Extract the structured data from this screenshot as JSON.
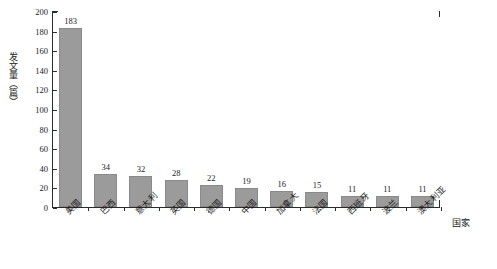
{
  "chart_data": {
    "type": "bar",
    "title": "",
    "xlabel": "国家",
    "ylabel": "发文量（篇）",
    "ylim": [
      0,
      200
    ],
    "ytick_step": 20,
    "yticks": [
      0,
      20,
      40,
      60,
      80,
      100,
      120,
      140,
      160,
      180,
      200
    ],
    "grid": false,
    "legend": null,
    "bar_color": "#9b9b9b",
    "axis_color": "#2b2b2b",
    "value_labels_shown": true,
    "categories": [
      "美国",
      "巴西",
      "意大利",
      "英国",
      "德国",
      "中国",
      "加拿大",
      "法国",
      "西班牙",
      "波兰",
      "澳大利亚"
    ],
    "values": [
      183,
      34,
      32,
      28,
      22,
      19,
      16,
      15,
      11,
      11,
      11
    ],
    "series": [
      {
        "name": "发文量",
        "values": [
          183,
          34,
          32,
          28,
          22,
          19,
          16,
          15,
          11,
          11,
          11
        ]
      }
    ]
  },
  "axis": {
    "y_title": "发文量（篇）",
    "x_title": "国家",
    "y_tick_labels": [
      "200",
      "180",
      "160",
      "140",
      "120",
      "100",
      "80",
      "60",
      "40",
      "20",
      "0"
    ]
  }
}
